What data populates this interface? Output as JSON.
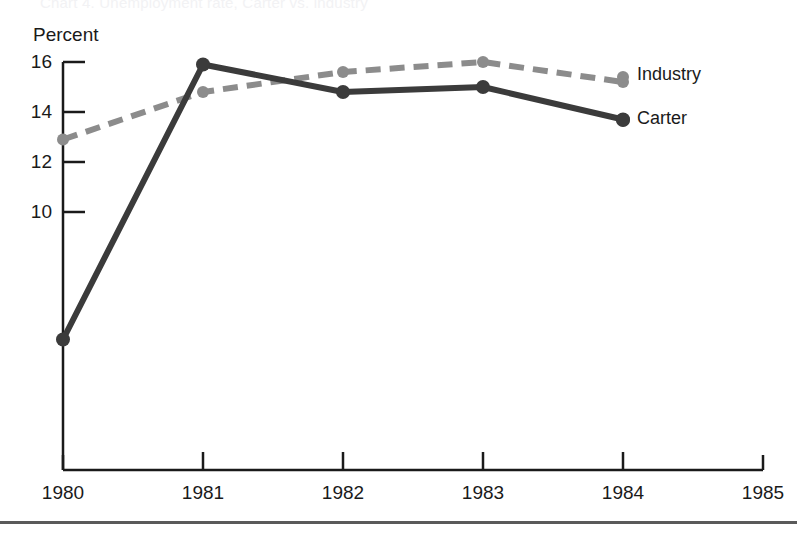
{
  "figure": {
    "ghost_title_fragment": "Chart 4.  Unemployment rate, Carter vs. industry",
    "bottom_rule": true
  },
  "chart_data": {
    "type": "line",
    "title": "",
    "xlabel": "",
    "ylabel": "Percent",
    "x": [
      1980,
      1981,
      1982,
      1983,
      1984
    ],
    "xtick_labels": [
      "1980",
      "1981",
      "1982",
      "1983",
      "1984",
      "1985"
    ],
    "xlim": [
      1980,
      1985
    ],
    "ytick_labels": [
      "16",
      "14",
      "12",
      "10"
    ],
    "yticks": [
      16,
      14,
      12,
      10
    ],
    "ylim_visible": [
      10,
      16
    ],
    "grid": false,
    "legend_position": "right-inline-end-of-line",
    "series": [
      {
        "name": "Industry",
        "values": [
          12.9,
          14.8,
          15.6,
          16.0,
          15.2
        ],
        "color": "#8c8c8c",
        "style": "dashed",
        "marker": "circle",
        "label": "Industry"
      },
      {
        "name": "Carter",
        "values": [
          4.9,
          15.9,
          14.8,
          15.0,
          13.7
        ],
        "color": "#3b3b3b",
        "style": "solid",
        "marker": "circle",
        "label": "Carter"
      }
    ]
  },
  "axis": {
    "y_label": "Percent",
    "y_ticks": [
      "16",
      "14",
      "12",
      "10"
    ],
    "x_ticks": [
      "1980",
      "1981",
      "1982",
      "1983",
      "1984",
      "1985"
    ]
  },
  "legend": {
    "industry_label": "Industry",
    "carter_label": "Carter"
  },
  "colors": {
    "industry": "#8c8c8c",
    "carter": "#3b3b3b",
    "axis": "#1a1a1a",
    "background": "#ffffff"
  }
}
